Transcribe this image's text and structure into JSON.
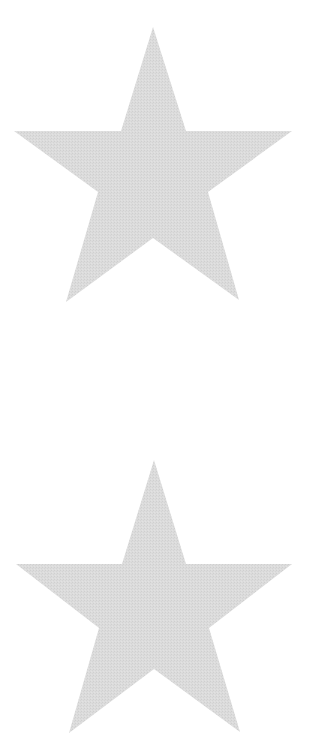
{
  "canvas": {
    "width": 322,
    "height": 756,
    "background": "#ffffff"
  },
  "stars": [
    {
      "name": "top-star",
      "fill": "#dadada",
      "points": [
        [
          153,
          27
        ],
        [
          186,
          131
        ],
        [
          292,
          131
        ],
        [
          208,
          192
        ],
        [
          239,
          300
        ],
        [
          153,
          238
        ],
        [
          66,
          302
        ],
        [
          98,
          192
        ],
        [
          14,
          131
        ],
        [
          121,
          131
        ]
      ]
    },
    {
      "name": "bottom-star",
      "fill": "#dadada",
      "points": [
        [
          154,
          460
        ],
        [
          186,
          564
        ],
        [
          292,
          564
        ],
        [
          209,
          628
        ],
        [
          240,
          732
        ],
        [
          154,
          669
        ],
        [
          69,
          733
        ],
        [
          99,
          628
        ],
        [
          16,
          564
        ],
        [
          122,
          564
        ]
      ]
    }
  ]
}
